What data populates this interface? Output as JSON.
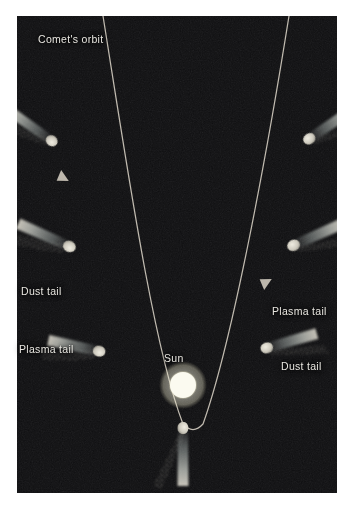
{
  "figure": {
    "background_color": "#ffffff",
    "panel_color": "#0d0d0f",
    "panel": {
      "x": 17,
      "y": 16,
      "width": 320,
      "height": 477
    }
  },
  "labels": {
    "comets_orbit": "Comet's orbit",
    "sun": "Sun",
    "dust_tail_left": "Dust tail",
    "plasma_tail_left": "Plasma tail",
    "plasma_tail_right": "Plasma tail",
    "dust_tail_right": "Dust tail"
  },
  "colors": {
    "orbit_line": "#cfc9bd",
    "label_text": "#e8e6e0",
    "sun_core": "#fbfbf2",
    "sun_glow": "#f2efd8",
    "plasma_tail": "#a9b0ae",
    "dust_tail": "#d8d3c6",
    "nucleus": "#dad6cb"
  },
  "sun": {
    "label": "Sun",
    "center_x": 183,
    "center_y": 385,
    "radius": 14
  },
  "orbit": {
    "shape": "parabola",
    "vertex_x": 183,
    "vertex_y": 424,
    "stroke_width": 1.2,
    "direction_arrows": [
      {
        "name": "inbound-arrow",
        "x": 62,
        "y": 170,
        "angle": 108
      },
      {
        "name": "outbound-arrow",
        "x": 263,
        "y": 287,
        "angle": -62
      }
    ]
  },
  "comets": [
    {
      "name": "comet-upper-left",
      "position": "inbound-far",
      "nucleus_x": 55,
      "nucleus_y": 143,
      "tail_angle_deg": 214,
      "tail_length": 62,
      "has_dust_trail": true
    },
    {
      "name": "comet-mid-left",
      "position": "inbound-near",
      "nucleus_x": 73,
      "nucleus_y": 248,
      "tail_angle_deg": 203,
      "tail_length": 62,
      "has_dust_trail": true
    },
    {
      "name": "comet-lower-left",
      "position": "pre-perihelion",
      "nucleus_x": 103,
      "nucleus_y": 352,
      "tail_angle_deg": 196,
      "tail_length": 58,
      "has_dust_trail": true
    },
    {
      "name": "comet-perihelion",
      "position": "perihelion",
      "nucleus_x": 183,
      "nucleus_y": 424,
      "tail_angle_deg": 90,
      "tail_length": 62,
      "has_dust_trail": true
    },
    {
      "name": "comet-lower-right",
      "position": "post-perihelion",
      "nucleus_x": 263,
      "nucleus_y": 349,
      "tail_angle_deg": -16,
      "tail_length": 58,
      "has_dust_trail": true
    },
    {
      "name": "comet-mid-right",
      "position": "outbound-near",
      "nucleus_x": 290,
      "nucleus_y": 247,
      "tail_angle_deg": -23,
      "tail_length": 60,
      "has_dust_trail": true
    },
    {
      "name": "comet-upper-right",
      "position": "outbound-far",
      "nucleus_x": 306,
      "nucleus_y": 141,
      "tail_angle_deg": -34,
      "tail_length": 60,
      "has_dust_trail": true
    }
  ]
}
